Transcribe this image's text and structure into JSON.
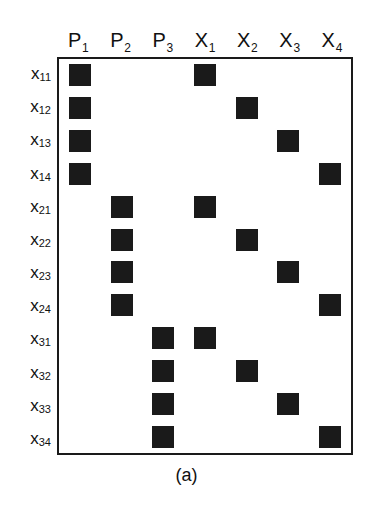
{
  "figure": {
    "caption": "(a)",
    "mark_color": "#1a1a1a",
    "border_color": "#1a1a1a",
    "background_color": "#ffffff"
  },
  "chart_data": {
    "type": "heatmap",
    "title": "(a)",
    "xlabel": "",
    "ylabel": "",
    "grid": false,
    "legend": "none",
    "columns": [
      {
        "base": "P",
        "sub": "1",
        "label": "P1"
      },
      {
        "base": "P",
        "sub": "2",
        "label": "P2"
      },
      {
        "base": "P",
        "sub": "3",
        "label": "P3"
      },
      {
        "base": "X",
        "sub": "1",
        "label": "X1"
      },
      {
        "base": "X",
        "sub": "2",
        "label": "X2"
      },
      {
        "base": "X",
        "sub": "3",
        "label": "X3"
      },
      {
        "base": "X",
        "sub": "4",
        "label": "X4"
      }
    ],
    "rows": [
      {
        "base": "x",
        "sub": "11",
        "label": "x11",
        "values": [
          1,
          0,
          0,
          1,
          0,
          0,
          0
        ]
      },
      {
        "base": "x",
        "sub": "12",
        "label": "x12",
        "values": [
          1,
          0,
          0,
          0,
          1,
          0,
          0
        ]
      },
      {
        "base": "x",
        "sub": "13",
        "label": "x13",
        "values": [
          1,
          0,
          0,
          0,
          0,
          1,
          0
        ]
      },
      {
        "base": "x",
        "sub": "14",
        "label": "x14",
        "values": [
          1,
          0,
          0,
          0,
          0,
          0,
          1
        ]
      },
      {
        "base": "x",
        "sub": "21",
        "label": "x21",
        "values": [
          0,
          1,
          0,
          1,
          0,
          0,
          0
        ]
      },
      {
        "base": "x",
        "sub": "22",
        "label": "x22",
        "values": [
          0,
          1,
          0,
          0,
          1,
          0,
          0
        ]
      },
      {
        "base": "x",
        "sub": "23",
        "label": "x23",
        "values": [
          0,
          1,
          0,
          0,
          0,
          1,
          0
        ]
      },
      {
        "base": "x",
        "sub": "24",
        "label": "x24",
        "values": [
          0,
          1,
          0,
          0,
          0,
          0,
          1
        ]
      },
      {
        "base": "x",
        "sub": "31",
        "label": "x31",
        "values": [
          0,
          0,
          1,
          1,
          0,
          0,
          0
        ]
      },
      {
        "base": "x",
        "sub": "32",
        "label": "x32",
        "values": [
          0,
          0,
          1,
          0,
          1,
          0,
          0
        ]
      },
      {
        "base": "x",
        "sub": "33",
        "label": "x33",
        "values": [
          0,
          0,
          1,
          0,
          0,
          1,
          0
        ]
      },
      {
        "base": "x",
        "sub": "34",
        "label": "x34",
        "values": [
          0,
          0,
          1,
          0,
          0,
          0,
          1
        ]
      }
    ]
  }
}
